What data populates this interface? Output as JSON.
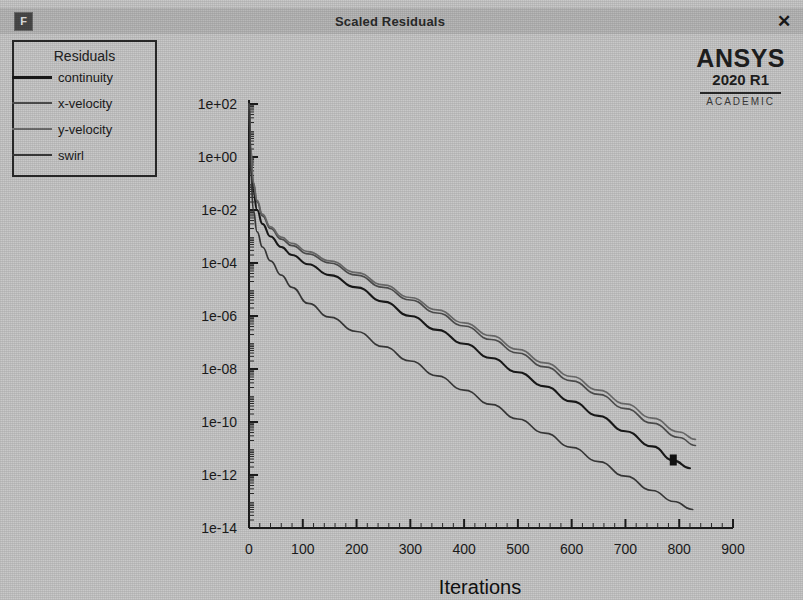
{
  "window": {
    "title": "Scaled Residuals",
    "app_icon": "F",
    "close_icon": "✕"
  },
  "branding": {
    "name": "ANSYS",
    "version": "2020 R1",
    "edition": "ACADEMIC"
  },
  "legend": {
    "title": "Residuals",
    "items": [
      {
        "label": "continuity",
        "color": "#1a1a1a"
      },
      {
        "label": "x-velocity",
        "color": "#4f4f4f"
      },
      {
        "label": "y-velocity",
        "color": "#6e6e6e"
      },
      {
        "label": "swirl",
        "color": "#3a3a3a"
      }
    ]
  },
  "chart_data": {
    "type": "line",
    "title": "Scaled Residuals",
    "xlabel": "Iterations",
    "ylabel": "",
    "yscale": "log",
    "xlim": [
      0,
      900
    ],
    "ylim": [
      1e-14,
      100.0
    ],
    "grid": false,
    "legend_position": "top-left",
    "xticks": [
      0,
      100,
      200,
      300,
      400,
      500,
      600,
      700,
      800,
      900
    ],
    "xticklabels": [
      "0",
      "100",
      "200",
      "300",
      "400",
      "500",
      "600",
      "700",
      "800",
      "900"
    ],
    "yticks": [
      100.0,
      1,
      0.01,
      0.0001,
      1e-06,
      1e-08,
      1e-10,
      1e-12,
      1e-14
    ],
    "yticklabels": [
      "1e+02",
      "1e+00",
      "1e-02",
      "1e-04",
      "1e-06",
      "1e-08",
      "1e-10",
      "1e-12",
      "1e-14"
    ],
    "series": [
      {
        "name": "continuity",
        "color": "#1a1a1a",
        "x": [
          0,
          3,
          8,
          15,
          25,
          40,
          60,
          80,
          110,
          150,
          200,
          250,
          300,
          350,
          400,
          450,
          500,
          550,
          600,
          650,
          700,
          750,
          790,
          820
        ],
        "y": [
          100.0,
          1.0,
          0.05,
          0.01,
          0.003,
          0.001,
          0.0004,
          0.0002,
          9e-05,
          3.5e-05,
          1.2e-05,
          3.5e-06,
          1e-06,
          3e-07,
          9e-08,
          2.6e-08,
          7.5e-09,
          2.2e-09,
          6e-10,
          1.7e-10,
          4.5e-11,
          1.2e-11,
          3.5e-12,
          1.8e-12
        ]
      },
      {
        "name": "x-velocity",
        "color": "#4f4f4f",
        "x": [
          0,
          3,
          8,
          15,
          25,
          40,
          60,
          80,
          110,
          150,
          200,
          250,
          300,
          350,
          400,
          450,
          500,
          550,
          600,
          650,
          700,
          750,
          800,
          830
        ],
        "y": [
          100.0,
          2.0,
          0.1,
          0.02,
          0.006,
          0.002,
          0.0008,
          0.00045,
          0.00022,
          0.0001,
          3.5e-05,
          1.2e-05,
          4e-06,
          1.3e-06,
          4.2e-07,
          1.3e-07,
          4e-08,
          1.2e-08,
          3.6e-09,
          1.1e-09,
          3.2e-10,
          9e-11,
          2.6e-11,
          1.3e-11
        ]
      },
      {
        "name": "y-velocity",
        "color": "#6e6e6e",
        "x": [
          0,
          3,
          8,
          15,
          25,
          40,
          60,
          80,
          110,
          150,
          200,
          250,
          300,
          350,
          400,
          450,
          500,
          550,
          600,
          650,
          700,
          750,
          800,
          830
        ],
        "y": [
          100.0,
          2.2,
          0.11,
          0.023,
          0.007,
          0.0023,
          0.00095,
          0.00055,
          0.00027,
          0.00012,
          4.3e-05,
          1.5e-05,
          5e-06,
          1.7e-06,
          5.5e-07,
          1.8e-07,
          5.5e-08,
          1.7e-08,
          5.2e-09,
          1.6e-09,
          4.8e-10,
          1.4e-10,
          4.2e-11,
          2.2e-11
        ]
      },
      {
        "name": "swirl",
        "color": "#3a3a3a",
        "x": [
          0,
          3,
          8,
          15,
          25,
          40,
          60,
          80,
          110,
          150,
          200,
          250,
          300,
          350,
          400,
          450,
          500,
          550,
          600,
          650,
          700,
          750,
          790,
          825
        ],
        "y": [
          100.0,
          0.3,
          0.01,
          0.0015,
          0.0004,
          0.00012,
          3.5e-05,
          1.2e-05,
          3e-06,
          9e-07,
          2.6e-07,
          7e-08,
          2e-08,
          5.5e-09,
          1.6e-09,
          4.6e-10,
          1.3e-10,
          3.8e-11,
          1.1e-11,
          3.2e-12,
          9e-13,
          2.6e-13,
          1e-13,
          5e-14
        ]
      }
    ]
  }
}
